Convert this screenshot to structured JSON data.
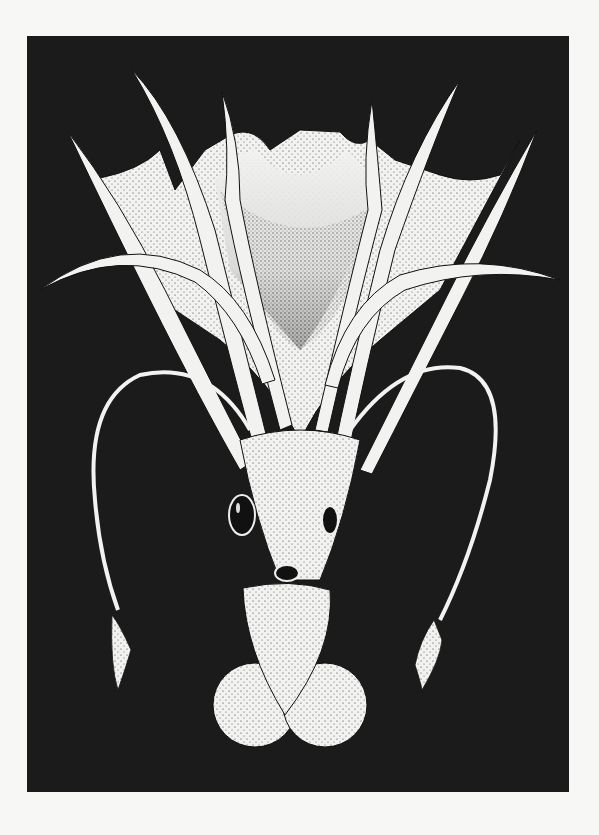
{
  "illustration": {
    "subject": "squid stipple illustration",
    "background_color": "#1b1b1b",
    "paper_color": "#f7f7f5",
    "ink_color": "#f2f2f0",
    "dot_color": "#222222"
  }
}
